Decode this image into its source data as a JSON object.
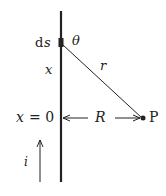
{
  "diagram": {
    "labels": {
      "element": "ds",
      "element_d": "d",
      "element_s": "s",
      "angle": "θ",
      "distance": "r",
      "position": "x",
      "origin_x": "x",
      "origin_eq": "= 0",
      "perp_distance": "R",
      "point": "P",
      "current": "i"
    },
    "colors": {
      "line": "#222222",
      "background": "#ffffff"
    }
  }
}
